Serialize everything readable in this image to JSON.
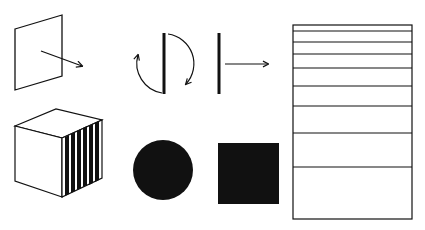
{
  "diagram": {
    "colors": {
      "ink": "#111111",
      "background": "#ffffff"
    },
    "figures": [
      {
        "id": "tilted-plane",
        "kind": "parallelogram-with-arrow"
      },
      {
        "id": "rotating-bar",
        "kind": "bar-with-rotation-arrows"
      },
      {
        "id": "bar-translation",
        "kind": "bar-with-right-arrow"
      },
      {
        "id": "striped-cube",
        "kind": "cube-with-striped-side"
      },
      {
        "id": "filled-circle",
        "kind": "circle"
      },
      {
        "id": "filled-square",
        "kind": "square"
      },
      {
        "id": "graded-rectangle",
        "kind": "rectangle-with-horizontal-lines",
        "line_y": [
          31,
          42,
          54,
          68,
          86,
          106,
          133,
          167
        ]
      }
    ]
  }
}
